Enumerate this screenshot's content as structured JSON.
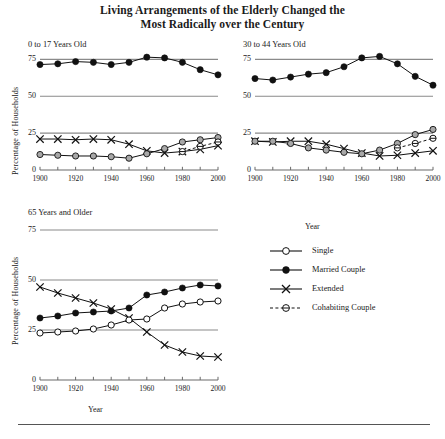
{
  "figure": {
    "title_line1": "Living Arrangements of the Elderly Changed the",
    "title_line2": "Most Radically over the Century",
    "axis_y_label": "Percentage of Households",
    "axis_x_label": "Year",
    "legend_heading": "Year"
  },
  "legend": {
    "items": [
      {
        "label": "Single",
        "marker": "open-circle",
        "line": "solid",
        "color": "#111111"
      },
      {
        "label": "Married Couple",
        "marker": "filled-circle",
        "line": "solid",
        "color": "#111111"
      },
      {
        "label": "Extended",
        "marker": "cross-x",
        "line": "solid",
        "color": "#111111"
      },
      {
        "label": "Cohabiting Couple",
        "marker": "circle-dash",
        "line": "dashed",
        "color": "#111111"
      }
    ]
  },
  "chart_data": [
    {
      "type": "line",
      "title": "0 to 17 Years Old",
      "xlabel": "Year",
      "ylabel": "Percentage of Households",
      "x": [
        1900,
        1910,
        1920,
        1930,
        1940,
        1950,
        1960,
        1970,
        1980,
        1990,
        2000
      ],
      "xlim": [
        1900,
        2000
      ],
      "ylim": [
        0,
        80
      ],
      "yticks": [
        0,
        25,
        50,
        75
      ],
      "xticks": [
        1900,
        1920,
        1940,
        1960,
        1980,
        2000
      ],
      "grid": true,
      "series": [
        {
          "name": "Married Couple",
          "marker": "filled-circle",
          "values": [
            71.5,
            72.0,
            73.5,
            73.0,
            71.5,
            73.0,
            76.5,
            76.0,
            73.0,
            68.0,
            64.5
          ]
        },
        {
          "name": "Extended",
          "marker": "cross-x",
          "values": [
            21.0,
            21.0,
            20.5,
            21.0,
            20.5,
            17.5,
            13.0,
            11.5,
            12.5,
            14.0,
            16.5
          ]
        },
        {
          "name": "Single",
          "marker": "open-circle",
          "values": [
            10.5,
            10.0,
            9.5,
            9.5,
            9.0,
            8.0,
            11.0,
            14.5,
            19.0,
            20.5,
            22.0
          ]
        },
        {
          "name": "Cohabiting Couple",
          "marker": "circle-dash",
          "values": [
            null,
            null,
            null,
            null,
            null,
            null,
            null,
            null,
            12.5,
            16.0,
            19.0
          ]
        }
      ]
    },
    {
      "type": "line",
      "title": "30 to 44 Years Old",
      "xlabel": "Year",
      "ylabel": "Percentage of Households",
      "x": [
        1900,
        1910,
        1920,
        1930,
        1940,
        1950,
        1960,
        1970,
        1980,
        1990,
        2000
      ],
      "xlim": [
        1900,
        2000
      ],
      "ylim": [
        0,
        80
      ],
      "yticks": [
        0,
        25,
        50,
        75
      ],
      "xticks": [
        1900,
        1920,
        1940,
        1960,
        1980,
        2000
      ],
      "grid": true,
      "series": [
        {
          "name": "Married Couple",
          "marker": "filled-circle",
          "values": [
            62.0,
            61.0,
            63.0,
            65.0,
            66.0,
            70.0,
            76.0,
            77.0,
            72.0,
            63.5,
            57.5
          ]
        },
        {
          "name": "Extended",
          "marker": "cross-x",
          "values": [
            19.5,
            19.0,
            19.5,
            19.5,
            17.5,
            14.5,
            11.5,
            9.5,
            10.0,
            11.5,
            13.0
          ]
        },
        {
          "name": "Single",
          "marker": "open-circle",
          "values": [
            19.5,
            19.5,
            18.0,
            15.0,
            13.5,
            12.0,
            11.0,
            13.5,
            18.0,
            24.0,
            27.5
          ]
        },
        {
          "name": "Cohabiting Couple",
          "marker": "circle-dash",
          "values": [
            null,
            null,
            null,
            null,
            null,
            null,
            null,
            null,
            15.0,
            18.0,
            21.5
          ]
        }
      ]
    },
    {
      "type": "line",
      "title": "65 Years and Older",
      "xlabel": "Year",
      "ylabel": "Percentage of Households",
      "x": [
        1900,
        1910,
        1920,
        1930,
        1940,
        1950,
        1960,
        1970,
        1980,
        1990,
        2000
      ],
      "xlim": [
        1900,
        2000
      ],
      "ylim": [
        0,
        80
      ],
      "yticks": [
        0,
        25,
        50,
        75
      ],
      "xticks": [
        1900,
        1920,
        1940,
        1960,
        1980,
        2000
      ],
      "grid": true,
      "series": [
        {
          "name": "Extended",
          "marker": "cross-x",
          "values": [
            46.5,
            43.5,
            41.0,
            38.5,
            35.5,
            31.0,
            24.0,
            17.5,
            14.0,
            12.0,
            11.5
          ]
        },
        {
          "name": "Married Couple",
          "marker": "filled-circle",
          "values": [
            31.0,
            32.0,
            33.5,
            34.0,
            34.5,
            36.0,
            42.5,
            44.0,
            46.0,
            47.5,
            47.0
          ]
        },
        {
          "name": "Single",
          "marker": "open-circle",
          "values": [
            23.5,
            24.0,
            24.5,
            25.5,
            27.5,
            30.0,
            30.5,
            36.0,
            38.0,
            39.0,
            39.5
          ]
        }
      ]
    }
  ]
}
